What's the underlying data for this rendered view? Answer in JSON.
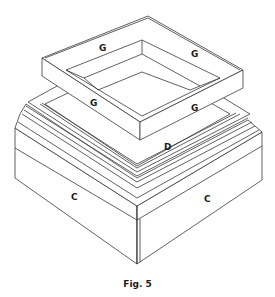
{
  "figure": {
    "caption": "Fig. 5",
    "labels": {
      "frame_back_left": "G",
      "frame_back_right": "G",
      "frame_front_left": "G",
      "frame_front_right": "G",
      "top_panel": "D",
      "base_left_face": "C",
      "base_right_face": "C"
    }
  },
  "colors": {
    "line": "#3a3a3a",
    "background": "#ffffff"
  }
}
